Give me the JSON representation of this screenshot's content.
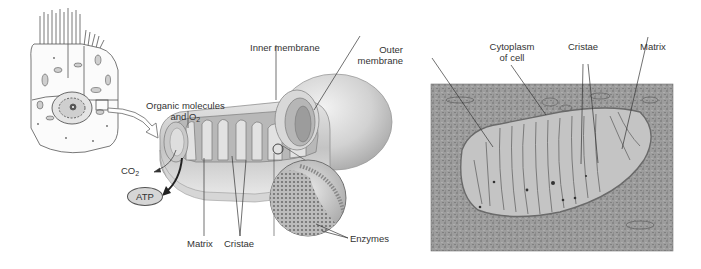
{
  "figure": {
    "panels": [
      {
        "id": "cell-sketch",
        "description": "Epithelial cell with microvilli"
      },
      {
        "id": "mitochondrion-illustration",
        "description": "Cutaway mitochondrion with enlarged crista detail"
      },
      {
        "id": "micrograph",
        "description": "Electron micrograph of mitochondrion"
      }
    ]
  },
  "labels": {
    "organic_molecules_line1": "Organic molecules",
    "organic_molecules_line2_prefix": "and O",
    "organic_molecules_line2_sub": "2",
    "co2_prefix": "CO",
    "co2_sub": "2",
    "atp": "ATP",
    "inner_membrane": "Inner membrane",
    "outer_membrane_line1": "Outer",
    "outer_membrane_line2": "membrane",
    "matrix_left": "Matrix",
    "cristae_left": "Cristae",
    "enzymes": "Enzymes",
    "cytoplasm_line1": "Cytoplasm",
    "cytoplasm_line2": "of cell",
    "cristae_right": "Cristae",
    "matrix_right": "Matrix"
  },
  "colors": {
    "text": "#333333",
    "line": "#333333",
    "membrane_light": "#e6e6e6",
    "membrane_mid": "#bdbdbd",
    "membrane_dark": "#8f8f8f",
    "micrograph": "#9a9a9a",
    "atp_fill": "#d6d6d6"
  }
}
